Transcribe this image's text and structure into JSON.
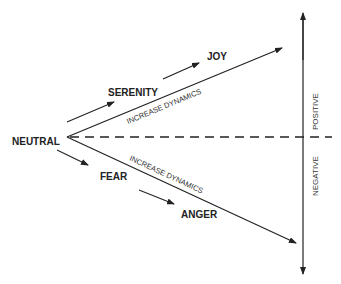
{
  "diagram": {
    "labels": {
      "neutral": "NEUTRAL",
      "serenity": "SERENITY",
      "joy": "JOY",
      "fear": "FEAR",
      "anger": "ANGER",
      "positive": "POSITIVE",
      "negative": "NEGATIVE",
      "upper_dynamics": "INCREASE DYNAMICS",
      "lower_dynamics": "INCREASE DYNAMICS"
    },
    "colors": {
      "line": "#222222",
      "background": "#ffffff"
    }
  }
}
